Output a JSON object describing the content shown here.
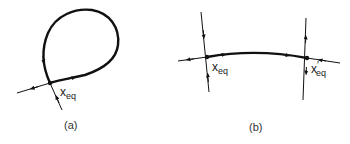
{
  "panels": [
    {
      "id": "a",
      "caption": "(a)",
      "equilibrium_label": {
        "base": "x",
        "prime": "",
        "sub": "eq"
      },
      "description": "Homoclinic orbit: a loop leaving and returning to a single saddle equilibrium"
    },
    {
      "id": "b",
      "caption": "(b)",
      "equilibrium_labels": [
        {
          "base": "x",
          "prime": "",
          "sub": "eq"
        },
        {
          "base": "x",
          "prime": "′",
          "sub": "eq"
        }
      ],
      "description": "Heteroclinic orbit: a trajectory connecting two distinct saddle equilibria"
    }
  ],
  "colors": {
    "stroke": "#111111",
    "text": "#222222",
    "background": "#ffffff"
  }
}
